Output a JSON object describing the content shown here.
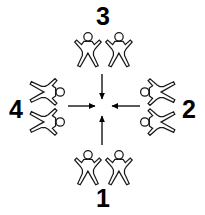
{
  "diagram": {
    "canvas": {
      "width": 205,
      "height": 215,
      "background": "#ffffff"
    },
    "stroke_color": "#1a1a1a",
    "arrow_color": "#000000",
    "label_color": "#000000",
    "center": {
      "x": 102,
      "y": 106
    },
    "groups": [
      {
        "id": "top",
        "label": "3",
        "position": "top",
        "figure_count": 2,
        "figure_orientation": "upright",
        "arrow_direction": "down",
        "arrow_points_to_center": true
      },
      {
        "id": "right",
        "label": "2",
        "position": "right",
        "figure_count": 2,
        "figure_orientation": "rotated-ccw",
        "arrow_direction": "left",
        "arrow_points_to_center": true
      },
      {
        "id": "bottom",
        "label": "1",
        "position": "bottom",
        "figure_count": 2,
        "figure_orientation": "upright",
        "arrow_direction": "up",
        "arrow_points_to_center": true
      },
      {
        "id": "left",
        "label": "4",
        "position": "left",
        "figure_count": 2,
        "figure_orientation": "rotated-cw",
        "arrow_direction": "right",
        "arrow_points_to_center": true
      }
    ]
  }
}
